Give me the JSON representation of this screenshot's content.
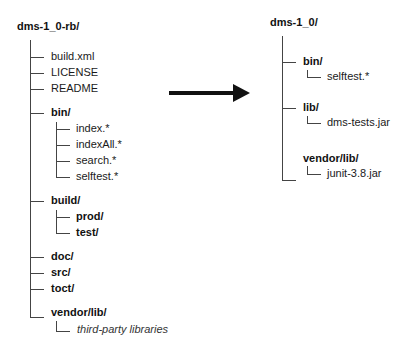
{
  "diagram": {
    "type": "directory-tree-transformation",
    "arrow": {
      "direction": "right",
      "color": "#111111"
    },
    "left_tree": {
      "root": "dms-1_0-rb/",
      "children": [
        {
          "label": "build.xml",
          "bold": false
        },
        {
          "label": "LICENSE",
          "bold": false
        },
        {
          "label": "README",
          "bold": false
        },
        {
          "label": "bin/",
          "bold_part": "bin",
          "children": [
            {
              "label": "index.*"
            },
            {
              "label": "indexAll.*"
            },
            {
              "label": "search.*"
            },
            {
              "label": "selftest.*"
            }
          ]
        },
        {
          "label": "build/",
          "bold_part": "build",
          "children": [
            {
              "label": "prod/"
            },
            {
              "label": "test/"
            }
          ]
        },
        {
          "label": "doc/"
        },
        {
          "label": "src/"
        },
        {
          "label": "toct/"
        },
        {
          "label": "vendor/lib/",
          "children": [
            {
              "label": "third-party libraries",
              "italic": true
            }
          ]
        }
      ]
    },
    "right_tree": {
      "root": "dms-1_0/",
      "children": [
        {
          "label": "bin/",
          "children": [
            {
              "label": "selftest.*"
            }
          ]
        },
        {
          "label": "lib/",
          "children": [
            {
              "label": "dms-tests.jar"
            }
          ]
        },
        {
          "label": "vendor/lib/",
          "children": [
            {
              "label": "junit-3.8.jar"
            }
          ]
        }
      ]
    }
  }
}
